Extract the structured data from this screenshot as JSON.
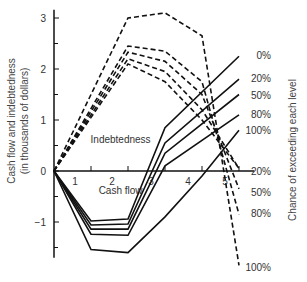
{
  "chart_data": {
    "type": "line",
    "title": "",
    "ylabel_line1": "Cash flow and indebtedness",
    "ylabel_line2": "(in thousands of dollars)",
    "right_label": "Chance of exceeding each level",
    "xlabel": "",
    "ylim": [
      -1.7,
      3.2
    ],
    "xlim": [
      0,
      5.3
    ],
    "y_ticks": [
      -1,
      0,
      1,
      2,
      3
    ],
    "y_tick_labels": [
      "−1",
      "0",
      "1",
      "2",
      "3"
    ],
    "x_ticks": [
      1,
      2,
      3,
      4,
      5
    ],
    "x_tick_labels": [
      "1",
      "2",
      "3",
      "4",
      "5"
    ],
    "grid": false,
    "annotations": [
      {
        "text": "Indebtedness",
        "x": 1.8,
        "y": 0.55
      },
      {
        "text": "Cash flow",
        "x": 1.8,
        "y": -0.45
      }
    ],
    "cash_flow_series": [
      {
        "name": "0%",
        "x": [
          0,
          1,
          2,
          3,
          5
        ],
        "values": [
          0,
          -0.98,
          -0.94,
          0.85,
          2.25
        ]
      },
      {
        "name": "20%",
        "x": [
          0,
          1,
          2,
          3,
          5
        ],
        "values": [
          0,
          -1.06,
          -1.04,
          0.55,
          1.8
        ]
      },
      {
        "name": "50%",
        "x": [
          0,
          1,
          2,
          3,
          5
        ],
        "values": [
          0,
          -1.14,
          -1.14,
          0.35,
          1.5
        ]
      },
      {
        "name": "80%",
        "x": [
          0,
          1,
          2,
          3,
          5
        ],
        "values": [
          0,
          -1.24,
          -1.26,
          0.1,
          1.1
        ]
      },
      {
        "name": "100%",
        "x": [
          0,
          1,
          2,
          3,
          4,
          5
        ],
        "values": [
          0,
          -1.54,
          -1.6,
          -0.9,
          -0.1,
          0.8
        ]
      }
    ],
    "indebtedness_series": [
      {
        "name": "100%",
        "x": [
          0,
          2,
          3,
          4,
          5
        ],
        "values": [
          0,
          3.0,
          3.1,
          2.65,
          -1.85
        ]
      },
      {
        "name": "80%",
        "x": [
          0,
          2,
          3,
          4,
          5
        ],
        "values": [
          0,
          2.45,
          2.35,
          1.75,
          -0.85
        ]
      },
      {
        "name": "50%",
        "x": [
          0,
          2,
          3,
          4,
          5
        ],
        "values": [
          0,
          2.33,
          2.15,
          1.5,
          -0.35
        ]
      },
      {
        "name": "20%",
        "x": [
          0,
          2,
          3,
          4,
          5
        ],
        "values": [
          0,
          2.2,
          1.95,
          1.2,
          0.05
        ]
      },
      {
        "name": "0%",
        "x": [
          0,
          2,
          3,
          4,
          5
        ],
        "values": [
          0,
          2.1,
          1.75,
          1.0,
          0.05
        ]
      }
    ],
    "cash_flow_labels": [
      "0%",
      "20%",
      "50%",
      "80%",
      "100%"
    ],
    "indebtedness_labels": [
      "20%",
      "50%",
      "80%",
      "100%"
    ]
  }
}
